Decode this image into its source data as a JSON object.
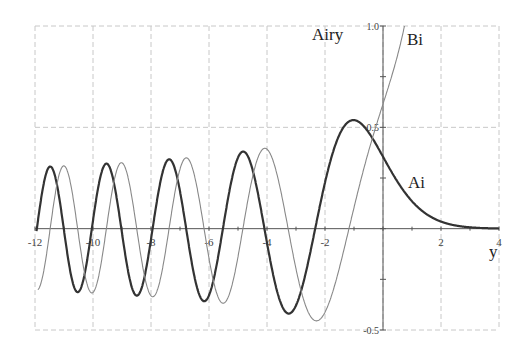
{
  "chart_data": {
    "type": "line",
    "title": "Airy",
    "xlabel": "y",
    "ylabel": "",
    "xlim": [
      -12,
      4
    ],
    "ylim": [
      -0.5,
      1.0
    ],
    "grid": true,
    "grid_style": "dashed",
    "x_ticks": [
      -12,
      -10,
      -8,
      -6,
      -4,
      -2,
      2,
      4
    ],
    "x_tick_labels": [
      "-12",
      "-10",
      "-8",
      "-6",
      "-4",
      "-2",
      "2",
      "4"
    ],
    "y_ticks": [
      -0.5,
      0.5,
      1.0
    ],
    "y_tick_labels": [
      "-0.5",
      "0.5",
      "1.0"
    ],
    "legend": "inline labels",
    "series": [
      {
        "name": "Ai",
        "color": "#333333",
        "line_width": 2.2,
        "label_pos": [
          1.0,
          0.22
        ],
        "initial_conditions_at_0": {
          "value": 0.355028,
          "derivative": -0.258819
        },
        "key_points": [
          {
            "x": -11.9,
            "y": 0.0
          },
          {
            "x": -11.5,
            "y": 0.3
          },
          {
            "x": -10.7,
            "y": -0.31
          },
          {
            "x": -9.6,
            "y": 0.32
          },
          {
            "x": -8.7,
            "y": -0.33
          },
          {
            "x": -7.4,
            "y": 0.34
          },
          {
            "x": -6.3,
            "y": -0.36
          },
          {
            "x": -4.8,
            "y": 0.38
          },
          {
            "x": -3.25,
            "y": -0.42
          },
          {
            "x": -1.02,
            "y": 0.536
          },
          {
            "x": 0,
            "y": 0.355
          },
          {
            "x": 2,
            "y": 0.035
          },
          {
            "x": 4,
            "y": 0.001
          }
        ]
      },
      {
        "name": "Bi",
        "color": "#888888",
        "line_width": 1.1,
        "label_pos": [
          0.85,
          0.92
        ],
        "initial_conditions_at_0": {
          "value": 0.614927,
          "derivative": 0.448288
        },
        "key_points": [
          {
            "x": -11.9,
            "y": -0.22
          },
          {
            "x": -11.0,
            "y": 0.3
          },
          {
            "x": -10.1,
            "y": -0.31
          },
          {
            "x": -9.2,
            "y": 0.32
          },
          {
            "x": -8.0,
            "y": -0.33
          },
          {
            "x": -6.8,
            "y": 0.34
          },
          {
            "x": -5.6,
            "y": -0.36
          },
          {
            "x": -4.1,
            "y": 0.38
          },
          {
            "x": -2.3,
            "y": -0.45
          },
          {
            "x": 0,
            "y": 0.615
          },
          {
            "x": 1.04,
            "y": 1.0
          }
        ]
      }
    ]
  },
  "labels": {
    "title": "Airy",
    "x_axis": "y",
    "ai": "Ai",
    "bi": "Bi"
  }
}
